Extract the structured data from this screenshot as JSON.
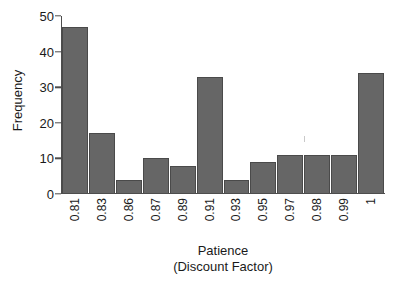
{
  "chart_data": {
    "type": "bar",
    "title": "",
    "subtitle": "",
    "xlabel": "Patience",
    "xlabel_line2": "(Discount Factor)",
    "ylabel": "Frequency",
    "categories": [
      "0.81",
      "0.83",
      "0.86",
      "0.87",
      "0.89",
      "0.91",
      "0.93",
      "0.95",
      "0.97",
      "0.98",
      "0.99",
      "1"
    ],
    "values": [
      47,
      17,
      4,
      10,
      8,
      33,
      4,
      9,
      11,
      11,
      11,
      34
    ],
    "ylim": [
      0,
      50
    ],
    "yticks": [
      0,
      10,
      20,
      30,
      40,
      50
    ],
    "ytick_labels": [
      "0",
      "10",
      "20",
      "30",
      "40",
      "50"
    ],
    "grid": false,
    "legend": null,
    "bar_color": "#666666",
    "bar_border_color": "#4a4a4a",
    "axis_color": "#4d4d4d",
    "background_color": "#ffffff"
  }
}
